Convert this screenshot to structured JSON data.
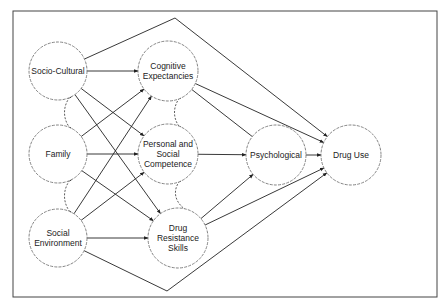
{
  "diagram": {
    "type": "path-model",
    "nodes": [
      {
        "id": "socio",
        "lines": [
          "Socio-Cultural"
        ],
        "cx": 58,
        "cy": 71,
        "r": 29
      },
      {
        "id": "cog",
        "lines": [
          "Cognitive",
          "Expectancies"
        ],
        "cx": 168,
        "cy": 71,
        "r": 30
      },
      {
        "id": "family",
        "lines": [
          "Family"
        ],
        "cx": 58,
        "cy": 154,
        "r": 29
      },
      {
        "id": "psc",
        "lines": [
          "Personal and",
          "Social",
          "Competence"
        ],
        "cx": 168,
        "cy": 154,
        "r": 30
      },
      {
        "id": "socenv",
        "lines": [
          "Social",
          "Environment"
        ],
        "cx": 58,
        "cy": 238,
        "r": 29
      },
      {
        "id": "drs",
        "lines": [
          "Drug",
          "Resistance",
          "Skills"
        ],
        "cx": 178,
        "cy": 238,
        "r": 30
      },
      {
        "id": "psych",
        "lines": [
          "Psychological"
        ],
        "cx": 276,
        "cy": 155,
        "r": 30
      },
      {
        "id": "druguse",
        "lines": [
          "Drug Use"
        ],
        "cx": 351,
        "cy": 155,
        "r": 30
      }
    ],
    "edges": [
      {
        "from": "socio",
        "to": "cog",
        "arrow": true
      },
      {
        "from": "socio",
        "to": "psc",
        "arrow": true
      },
      {
        "from": "socio",
        "to": "drs",
        "arrow": true
      },
      {
        "from": "family",
        "to": "cog",
        "arrow": true
      },
      {
        "from": "family",
        "to": "psc",
        "arrow": true
      },
      {
        "from": "family",
        "to": "drs",
        "arrow": true
      },
      {
        "from": "socenv",
        "to": "cog",
        "arrow": true
      },
      {
        "from": "socenv",
        "to": "psc",
        "arrow": true
      },
      {
        "from": "socenv",
        "to": "drs",
        "arrow": true
      },
      {
        "from": "cog",
        "to": "psych",
        "arrow": false
      },
      {
        "from": "psc",
        "to": "psych",
        "arrow": true
      },
      {
        "from": "drs",
        "to": "psych",
        "arrow": true
      },
      {
        "from": "psych",
        "to": "druguse",
        "arrow": true
      },
      {
        "from": "cog",
        "to": "druguse",
        "arrow": true
      },
      {
        "from": "drs",
        "to": "druguse",
        "arrow": true
      }
    ],
    "bent_edges": [
      {
        "from": "socio",
        "to": "druguse",
        "via": [
          175,
          18
        ]
      },
      {
        "from": "socenv",
        "to": "druguse",
        "via": [
          167,
          291
        ]
      }
    ],
    "correlations": [
      {
        "a": "socio",
        "b": "family"
      },
      {
        "a": "family",
        "b": "socenv"
      },
      {
        "a": "cog",
        "b": "psc"
      },
      {
        "a": "psc",
        "b": "drs"
      }
    ]
  }
}
